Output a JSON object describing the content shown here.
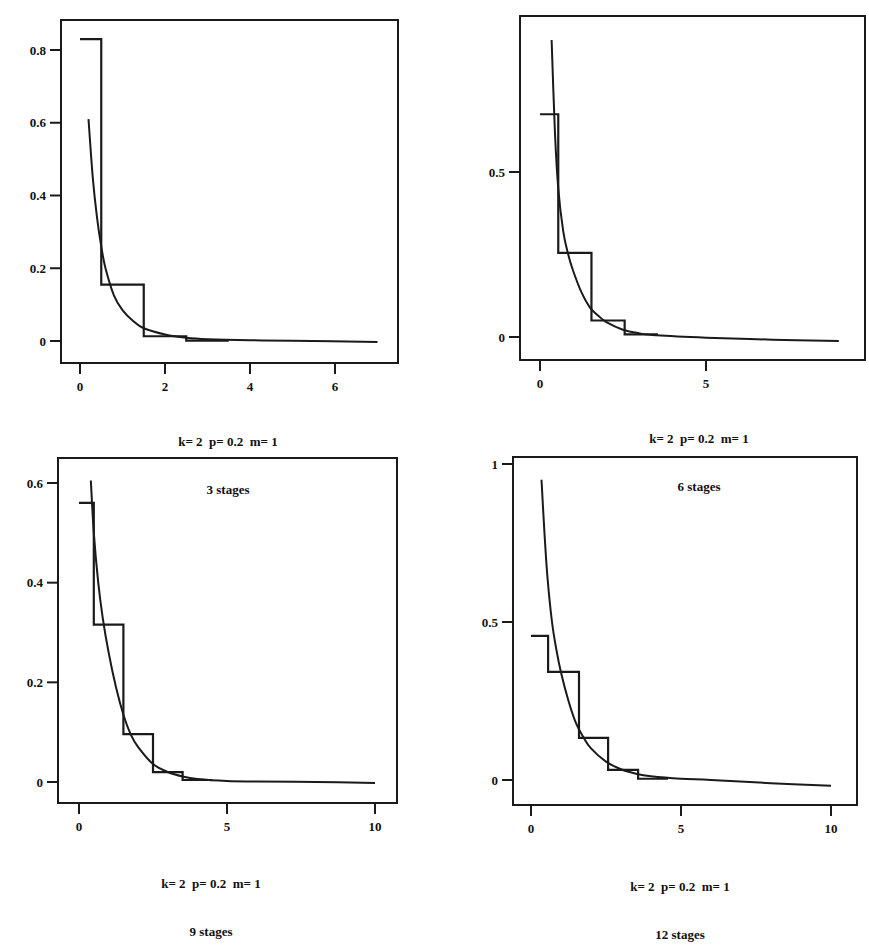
{
  "chart_data": [
    {
      "type": "line",
      "title": "",
      "caption_line1": "k= 2  p= 0.2  m= 1",
      "caption_line2": "3 stages",
      "xlabel": "",
      "ylabel": "",
      "xlim": [
        -0.05,
        7.3
      ],
      "ylim": [
        -0.06,
        0.88
      ],
      "xticks": [
        0,
        2,
        4,
        6
      ],
      "xtick_labels": [
        "0",
        "2",
        "4",
        "6"
      ],
      "yticks": [
        0,
        0.2,
        0.4,
        0.6,
        0.8
      ],
      "ytick_labels": [
        "0",
        "0.2",
        "0.4",
        "0.6",
        "0.8"
      ],
      "grid": false,
      "legend": null,
      "series": [
        {
          "name": "step approximation",
          "kind": "step",
          "steps": [
            {
              "x0": 0.0,
              "x1": 0.5,
              "y": 0.83
            },
            {
              "x0": 0.5,
              "x1": 1.5,
              "y": 0.155
            },
            {
              "x0": 1.5,
              "x1": 2.5,
              "y": 0.013
            },
            {
              "x0": 2.5,
              "x1": 3.5,
              "y": 0.001
            }
          ]
        },
        {
          "name": "density curve",
          "kind": "curve",
          "x": [
            0.2,
            0.3,
            0.4,
            0.5,
            0.6,
            0.8,
            1.0,
            1.25,
            1.5,
            2.0,
            2.5,
            3.0,
            4.0,
            5.0,
            7.0
          ],
          "y": [
            0.61,
            0.45,
            0.34,
            0.26,
            0.2,
            0.125,
            0.085,
            0.055,
            0.035,
            0.018,
            0.009,
            0.005,
            0.002,
            0.001,
            -0.003
          ]
        }
      ]
    },
    {
      "type": "line",
      "title": "",
      "caption_line1": "k= 2  p= 0.2  m= 1",
      "caption_line2": "6 stages",
      "xlabel": "",
      "ylabel": "",
      "xlim": [
        -0.65,
        9.8
      ],
      "ylim": [
        -0.07,
        1.0
      ],
      "xticks": [
        0,
        5
      ],
      "xtick_labels": [
        "0",
        "5"
      ],
      "yticks": [
        0,
        0.5
      ],
      "ytick_labels": [
        "0",
        "0.5"
      ],
      "grid": false,
      "legend": null,
      "series": [
        {
          "name": "step approximation",
          "kind": "step",
          "steps": [
            {
              "x0": 0.0,
              "x1": 0.55,
              "y": 0.675
            },
            {
              "x0": 0.55,
              "x1": 1.55,
              "y": 0.255
            },
            {
              "x0": 1.55,
              "x1": 2.55,
              "y": 0.05
            },
            {
              "x0": 2.55,
              "x1": 3.55,
              "y": 0.008
            }
          ]
        },
        {
          "name": "density curve",
          "kind": "curve",
          "x": [
            0.35,
            0.45,
            0.55,
            0.7,
            0.85,
            1.0,
            1.25,
            1.5,
            1.75,
            2.0,
            2.5,
            3.0,
            3.5,
            5.0,
            7.0,
            9.0
          ],
          "y": [
            0.9,
            0.62,
            0.45,
            0.32,
            0.25,
            0.2,
            0.135,
            0.09,
            0.065,
            0.045,
            0.022,
            0.011,
            0.005,
            -0.002,
            -0.008,
            -0.012
          ]
        }
      ]
    },
    {
      "type": "line",
      "title": "",
      "caption_line1": "k= 2  p= 0.2  m= 1",
      "caption_line2": "9 stages",
      "xlabel": "",
      "ylabel": "",
      "xlim": [
        -0.7,
        10.8
      ],
      "ylim": [
        -0.045,
        0.65
      ],
      "xticks": [
        0,
        5,
        10
      ],
      "xtick_labels": [
        "0",
        "5",
        "10"
      ],
      "yticks": [
        0,
        0.2,
        0.4,
        0.6
      ],
      "ytick_labels": [
        "0",
        "0.2",
        "0.4",
        "0.6"
      ],
      "grid": false,
      "legend": null,
      "series": [
        {
          "name": "step approximation",
          "kind": "step",
          "steps": [
            {
              "x0": 0.0,
              "x1": 0.5,
              "y": 0.56
            },
            {
              "x0": 0.5,
              "x1": 1.5,
              "y": 0.316
            },
            {
              "x0": 1.5,
              "x1": 2.5,
              "y": 0.096
            },
            {
              "x0": 2.5,
              "x1": 3.5,
              "y": 0.02
            },
            {
              "x0": 3.5,
              "x1": 4.5,
              "y": 0.004
            }
          ]
        },
        {
          "name": "density curve",
          "kind": "curve",
          "x": [
            0.4,
            0.5,
            0.65,
            0.8,
            1.0,
            1.25,
            1.5,
            1.75,
            2.0,
            2.5,
            3.0,
            3.5,
            4.0,
            5.0,
            6.0,
            8.0,
            10.0
          ],
          "y": [
            0.605,
            0.5,
            0.4,
            0.33,
            0.26,
            0.19,
            0.135,
            0.095,
            0.07,
            0.036,
            0.02,
            0.011,
            0.006,
            0.002,
            0.001,
            0.0,
            -0.002
          ]
        }
      ]
    },
    {
      "type": "line",
      "title": "",
      "caption_line1": "k= 2  p= 0.2  m= 1",
      "caption_line2": "12 stages",
      "xlabel": "",
      "ylabel": "",
      "xlim": [
        -0.6,
        10.8
      ],
      "ylim": [
        -0.075,
        1.02
      ],
      "xticks": [
        0,
        5,
        10
      ],
      "xtick_labels": [
        "0",
        "5",
        "10"
      ],
      "yticks": [
        0,
        0.5,
        1
      ],
      "ytick_labels": [
        "0",
        "0.5",
        "1"
      ],
      "grid": false,
      "legend": null,
      "series": [
        {
          "name": "step approximation",
          "kind": "step",
          "steps": [
            {
              "x0": 0.0,
              "x1": 0.57,
              "y": 0.456
            },
            {
              "x0": 0.57,
              "x1": 1.6,
              "y": 0.342
            },
            {
              "x0": 1.6,
              "x1": 2.57,
              "y": 0.133
            },
            {
              "x0": 2.57,
              "x1": 3.57,
              "y": 0.032
            },
            {
              "x0": 3.57,
              "x1": 4.57,
              "y": 0.004
            }
          ]
        },
        {
          "name": "density curve",
          "kind": "curve",
          "x": [
            0.35,
            0.45,
            0.55,
            0.7,
            0.85,
            1.0,
            1.25,
            1.5,
            1.75,
            2.0,
            2.5,
            3.0,
            3.5,
            4.0,
            5.0,
            6.0,
            8.0,
            10.0
          ],
          "y": [
            0.95,
            0.78,
            0.64,
            0.5,
            0.41,
            0.34,
            0.25,
            0.18,
            0.135,
            0.1,
            0.058,
            0.034,
            0.02,
            0.012,
            0.004,
            0.0,
            -0.01,
            -0.018
          ]
        }
      ]
    }
  ],
  "panels": [
    {
      "id": "panel-3-stages",
      "left": 0,
      "top": 0,
      "frame": {
        "x0": 61,
        "y0": 20,
        "x1": 398,
        "y1": 363
      },
      "plot": {
        "px0": 80,
        "px1": 335,
        "vx0": 0,
        "vx1": 6,
        "py0": 341,
        "py1": 50,
        "vy0": 0,
        "vy1": 0.8
      },
      "caption": {
        "cx": 228,
        "y": 402
      }
    },
    {
      "id": "panel-6-stages",
      "left": 0,
      "top": 0,
      "frame": {
        "x0": 520,
        "y0": 16,
        "x1": 865,
        "y1": 360
      },
      "plot": {
        "px0": 540,
        "px1": 706,
        "vx0": 0,
        "vx1": 5,
        "py0": 337,
        "py1": 172,
        "vy0": 0,
        "vy1": 0.5
      },
      "caption": {
        "cx": 699,
        "y": 399
      }
    },
    {
      "id": "panel-9-stages",
      "left": 0,
      "top": 0,
      "frame": {
        "x0": 58,
        "y0": 458,
        "x1": 397,
        "y1": 803
      },
      "plot": {
        "px0": 79,
        "px1": 375,
        "vx0": 0,
        "vx1": 10,
        "py0": 782,
        "py1": 483,
        "vy0": 0,
        "vy1": 0.6
      },
      "caption": {
        "cx": 211,
        "y": 844
      }
    },
    {
      "id": "panel-12-stages",
      "left": 0,
      "top": 0,
      "frame": {
        "x0": 513,
        "y0": 457,
        "x1": 857,
        "y1": 805
      },
      "plot": {
        "px0": 531,
        "px1": 831,
        "vx0": 0,
        "vx1": 10,
        "py0": 780,
        "py1": 464,
        "vy0": 0,
        "vy1": 1
      },
      "caption": {
        "cx": 680,
        "y": 847
      }
    }
  ],
  "colors": {
    "ink": "#1a1a1a",
    "background": "#ffffff"
  }
}
